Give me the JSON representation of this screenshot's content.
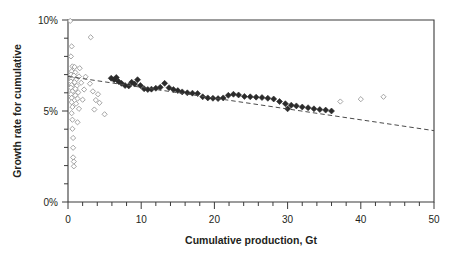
{
  "chart_data": {
    "type": "scatter",
    "title": "",
    "subtitle": "",
    "xlabel": "Cumulative production, Gt",
    "ylabel": "Growth rate for cumulative",
    "xlim": [
      0,
      50
    ],
    "ylim": [
      0,
      0.1
    ],
    "grid": false,
    "legend": "none",
    "x_ticks_major": [
      0,
      10,
      20,
      30,
      40,
      50
    ],
    "x_tick_labels": [
      "0",
      "10",
      "20",
      "30",
      "40",
      "50"
    ],
    "x_tick_minor_step": 2,
    "y_ticks_major": [
      0,
      0.05,
      0.1
    ],
    "y_tick_labels": [
      "0%",
      "5%",
      "10%"
    ],
    "y_tick_minor_step": 0.01,
    "series": [
      {
        "name": "open-markers",
        "marker": "open-diamond",
        "color": "#9a9a9a",
        "points": [
          [
            0.3,
            0.0995
          ],
          [
            0.5,
            0.0855
          ],
          [
            3.1,
            0.0905
          ],
          [
            0.4,
            0.08
          ],
          [
            0.6,
            0.0745
          ],
          [
            0.9,
            0.0742
          ],
          [
            1.6,
            0.0735
          ],
          [
            0.5,
            0.0718
          ],
          [
            1.0,
            0.0712
          ],
          [
            0.4,
            0.07
          ],
          [
            0.8,
            0.0695
          ],
          [
            1.5,
            0.069
          ],
          [
            2.4,
            0.0688
          ],
          [
            0.5,
            0.0678
          ],
          [
            1.1,
            0.0672
          ],
          [
            0.4,
            0.0662
          ],
          [
            0.9,
            0.0658
          ],
          [
            1.8,
            0.0655
          ],
          [
            3.0,
            0.065
          ],
          [
            0.5,
            0.0642
          ],
          [
            1.2,
            0.0638
          ],
          [
            0.4,
            0.0628
          ],
          [
            1.0,
            0.0622
          ],
          [
            2.2,
            0.0618
          ],
          [
            0.6,
            0.0608
          ],
          [
            1.4,
            0.0602
          ],
          [
            0.4,
            0.0592
          ],
          [
            1.0,
            0.0586
          ],
          [
            3.4,
            0.0608
          ],
          [
            4.1,
            0.0592
          ],
          [
            0.5,
            0.0572
          ],
          [
            1.3,
            0.0568
          ],
          [
            2.0,
            0.0562
          ],
          [
            3.8,
            0.056
          ],
          [
            0.5,
            0.0548
          ],
          [
            1.1,
            0.054
          ],
          [
            4.3,
            0.0545
          ],
          [
            0.6,
            0.0522
          ],
          [
            1.5,
            0.0512
          ],
          [
            3.6,
            0.0508
          ],
          [
            0.5,
            0.0488
          ],
          [
            5.0,
            0.0482
          ],
          [
            0.6,
            0.0452
          ],
          [
            1.3,
            0.0438
          ],
          [
            0.6,
            0.0402
          ],
          [
            0.7,
            0.0352
          ],
          [
            0.7,
            0.0298
          ],
          [
            0.7,
            0.0245
          ],
          [
            0.8,
            0.0222
          ],
          [
            0.8,
            0.0196
          ],
          [
            37.2,
            0.0552
          ],
          [
            40.0,
            0.0565
          ],
          [
            43.1,
            0.0578
          ]
        ]
      },
      {
        "name": "filled-markers",
        "marker": "filled-diamond",
        "color": "#2b2b2b",
        "points": [
          [
            5.9,
            0.068
          ],
          [
            6.3,
            0.0672
          ],
          [
            6.6,
            0.0684
          ],
          [
            6.9,
            0.0662
          ],
          [
            7.3,
            0.0652
          ],
          [
            7.8,
            0.064
          ],
          [
            8.3,
            0.0638
          ],
          [
            8.7,
            0.0658
          ],
          [
            9.1,
            0.0648
          ],
          [
            9.5,
            0.0672
          ],
          [
            9.9,
            0.064
          ],
          [
            10.4,
            0.0622
          ],
          [
            10.9,
            0.0618
          ],
          [
            11.4,
            0.062
          ],
          [
            12.0,
            0.0625
          ],
          [
            12.6,
            0.063
          ],
          [
            13.2,
            0.0652
          ],
          [
            13.8,
            0.0628
          ],
          [
            14.4,
            0.0618
          ],
          [
            15.0,
            0.0612
          ],
          [
            15.6,
            0.0605
          ],
          [
            16.3,
            0.06
          ],
          [
            17.0,
            0.0598
          ],
          [
            17.7,
            0.0596
          ],
          [
            18.4,
            0.0578
          ],
          [
            19.1,
            0.0572
          ],
          [
            19.8,
            0.057
          ],
          [
            20.5,
            0.0568
          ],
          [
            21.2,
            0.0572
          ],
          [
            21.9,
            0.0586
          ],
          [
            22.6,
            0.0592
          ],
          [
            23.3,
            0.0588
          ],
          [
            24.1,
            0.058
          ],
          [
            24.9,
            0.0578
          ],
          [
            25.7,
            0.0576
          ],
          [
            26.5,
            0.0574
          ],
          [
            27.3,
            0.057
          ],
          [
            28.1,
            0.0566
          ],
          [
            28.9,
            0.0552
          ],
          [
            29.7,
            0.054
          ],
          [
            30.5,
            0.0532
          ],
          [
            31.2,
            0.0528
          ],
          [
            30.0,
            0.0512
          ],
          [
            32.0,
            0.0522
          ],
          [
            32.8,
            0.0518
          ],
          [
            33.6,
            0.0512
          ],
          [
            34.4,
            0.0508
          ],
          [
            35.2,
            0.0505
          ],
          [
            36.0,
            0.05
          ]
        ]
      }
    ],
    "trendline": {
      "name": "dashed-trend",
      "style": "dashed",
      "x_start": 0,
      "y_start": 0.069,
      "x_end": 50,
      "y_end": 0.0392
    }
  }
}
